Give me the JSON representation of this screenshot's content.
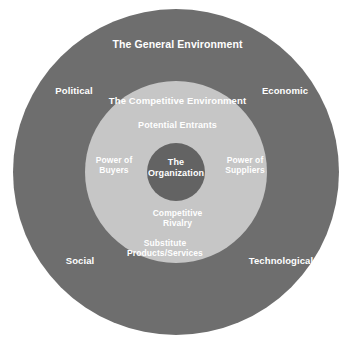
{
  "diagram": {
    "type": "concentric-circles",
    "background_color": "#ffffff",
    "rings": {
      "outer": {
        "name": "The General Environment",
        "color": "#6e6e6e",
        "radius": 163
      },
      "middle": {
        "name": "The Competitive Environment",
        "color": "#c6c6c6",
        "radius": 91
      },
      "core": {
        "name": "The Organization",
        "color": "#636363",
        "radius": 29
      }
    },
    "text_color": "#ffffff"
  },
  "outer_ring": {
    "title": "The General Environment",
    "factors": {
      "political": "Political",
      "economic": "Economic",
      "social": "Social",
      "technological": "Technological"
    }
  },
  "middle_ring": {
    "title": "The Competitive Environment",
    "forces": {
      "potential_entrants": "Potential Entrants",
      "power_of_buyers": "Power of\nBuyers",
      "power_of_suppliers": "Power of\nSuppliers",
      "competitive_rivalry": "Competitive\nRivalry",
      "substitute_products": "Substitute\nProducts/Services"
    }
  },
  "core": {
    "title": "The\nOrganization"
  }
}
